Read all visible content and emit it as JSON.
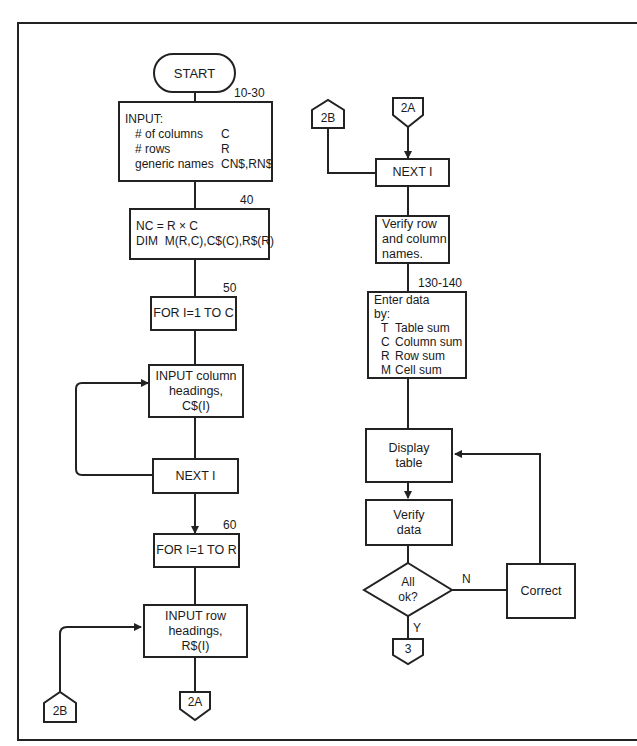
{
  "diagram": {
    "type": "flowchart",
    "nodes": {
      "start": {
        "label": "START"
      },
      "input": {
        "line_ref": "10-30",
        "title": "INPUT:",
        "rows": [
          {
            "key": "# of columns",
            "value": "C"
          },
          {
            "key": "# rows",
            "value": "R"
          },
          {
            "key": "generic names",
            "value": "CN$,RN$"
          }
        ]
      },
      "dim": {
        "line_ref": "40",
        "lines": [
          "NC = R × C",
          "DIM  M(R,C),C$(C),R$(R)"
        ]
      },
      "for_c": {
        "line_ref": "50",
        "label": "FOR I=1 TO C"
      },
      "input_col": {
        "lines": [
          "INPUT column",
          "headings,",
          "C$(I)"
        ]
      },
      "next_i_left": {
        "label": "NEXT I"
      },
      "for_r": {
        "line_ref": "60",
        "label": "FOR I=1 TO R"
      },
      "input_row": {
        "lines": [
          "INPUT row",
          "headings,",
          "R$(I)"
        ]
      },
      "conn_2b_left": {
        "label": "2B"
      },
      "conn_2a_left": {
        "label": "2A"
      },
      "conn_2b_right": {
        "label": "2B"
      },
      "conn_2a_right": {
        "label": "2A"
      },
      "next_i_right": {
        "label": "NEXT I"
      },
      "verify_names": {
        "lines": [
          "Verify row",
          "and column",
          "names."
        ]
      },
      "enter_data": {
        "line_ref": "130-140",
        "lines": [
          "Enter data",
          "by:"
        ],
        "options": [
          {
            "key": "T",
            "value": "Table sum"
          },
          {
            "key": "C",
            "value": "Column sum"
          },
          {
            "key": "R",
            "value": "Row sum"
          },
          {
            "key": "M",
            "value": "Cell sum"
          }
        ]
      },
      "display_table": {
        "lines": [
          "Display",
          "table"
        ]
      },
      "verify_data": {
        "lines": [
          "Verify",
          "data"
        ]
      },
      "decision": {
        "lines": [
          "All",
          "ok?"
        ],
        "yes": "Y",
        "no": "N"
      },
      "correct": {
        "label": "Correct"
      },
      "conn_3": {
        "label": "3"
      }
    }
  }
}
